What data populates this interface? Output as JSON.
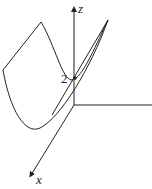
{
  "diagram": {
    "type": "3d-surface-sketch",
    "axes": {
      "z_label": "z",
      "x_label": "x"
    },
    "annotations": {
      "intercept_label": "2"
    },
    "colors": {
      "stroke": "#222222",
      "background": "#ffffff"
    }
  }
}
